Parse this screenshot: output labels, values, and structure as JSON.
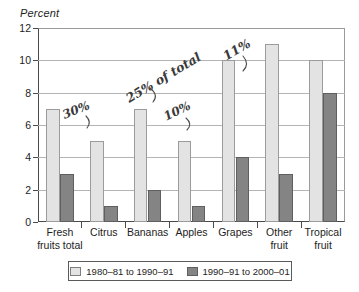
{
  "chart_data": {
    "type": "bar",
    "title": "",
    "ylabel": "Percent",
    "xlabel": "",
    "ylim": [
      0,
      12
    ],
    "yticks": [
      0,
      2,
      4,
      6,
      8,
      10,
      12
    ],
    "grid": true,
    "legend_position": "bottom",
    "categories": [
      "Fresh\nfruits total",
      "Citrus",
      "Bananas",
      "Apples",
      "Grapes",
      "Other\nfruit",
      "Tropical\nfruit"
    ],
    "category_lines": [
      [
        "Fresh",
        "fruits total"
      ],
      [
        "Citrus",
        ""
      ],
      [
        "Bananas",
        ""
      ],
      [
        "Apples",
        ""
      ],
      [
        "Grapes",
        ""
      ],
      [
        "Other",
        "fruit"
      ],
      [
        "Tropical",
        "fruit"
      ]
    ],
    "series": [
      {
        "name": "1980–81 to 1990–91",
        "color": "#e3e3e3",
        "values": [
          7,
          5,
          7,
          5,
          10,
          11,
          10
        ]
      },
      {
        "name": "1990–91 to 2000–01",
        "color": "#848484",
        "values": [
          3,
          1,
          2,
          1,
          4,
          3,
          8
        ]
      }
    ],
    "annotations": [
      {
        "id": "ann-30",
        "text": "30%"
      },
      {
        "id": "ann-25",
        "text": "25% of total"
      },
      {
        "id": "ann-10",
        "text": "10%"
      },
      {
        "id": "ann-11",
        "text": "11%"
      }
    ]
  },
  "axis": {
    "y_title": "Percent",
    "ytick_labels": [
      "12",
      "10",
      "8",
      "6",
      "4",
      "2",
      "0"
    ]
  },
  "legend": {
    "series_0_label": "1980–81 to 1990–91",
    "series_1_label": "1990–91 to 2000–01"
  },
  "annotations": {
    "citrus": "30%",
    "bananas": "25% of total",
    "apples": "10%",
    "grapes": "11%"
  }
}
